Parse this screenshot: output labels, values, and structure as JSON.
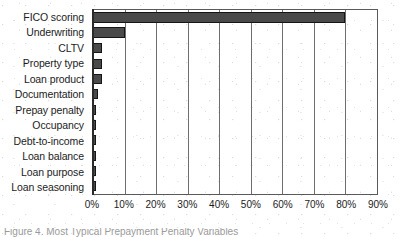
{
  "chart_data": {
    "type": "bar",
    "orientation": "horizontal",
    "title": "",
    "xlabel": "",
    "ylabel": "",
    "categories": [
      "FICO scoring",
      "Underwriting",
      "CLTV",
      "Property type",
      "Loan product",
      "Documentation",
      "Prepay penalty",
      "Occupancy",
      "Debt-to-income",
      "Loan balance",
      "Loan purpose",
      "Loan seasoning"
    ],
    "values": [
      80,
      10,
      3,
      3,
      3,
      1.5,
      1,
      1,
      1,
      1,
      1,
      1
    ],
    "value_unit": "%",
    "xlim": [
      0,
      90
    ],
    "xticks": [
      0,
      10,
      20,
      30,
      40,
      50,
      60,
      70,
      80,
      90
    ],
    "xtick_labels": [
      "0%",
      "10%",
      "20%",
      "30%",
      "40%",
      "50%",
      "60%",
      "70%",
      "80%",
      "90%"
    ],
    "grid": true,
    "grid_axis": "x",
    "legend": false,
    "bar_color": "#4a4a4a",
    "bar_edge_color": "#151515",
    "plot_background": "#ffffff",
    "axis_color": "#5a5a5a"
  },
  "caption": {
    "text": "Figure 4. Most Typical Prepayment Penalty Variables"
  }
}
